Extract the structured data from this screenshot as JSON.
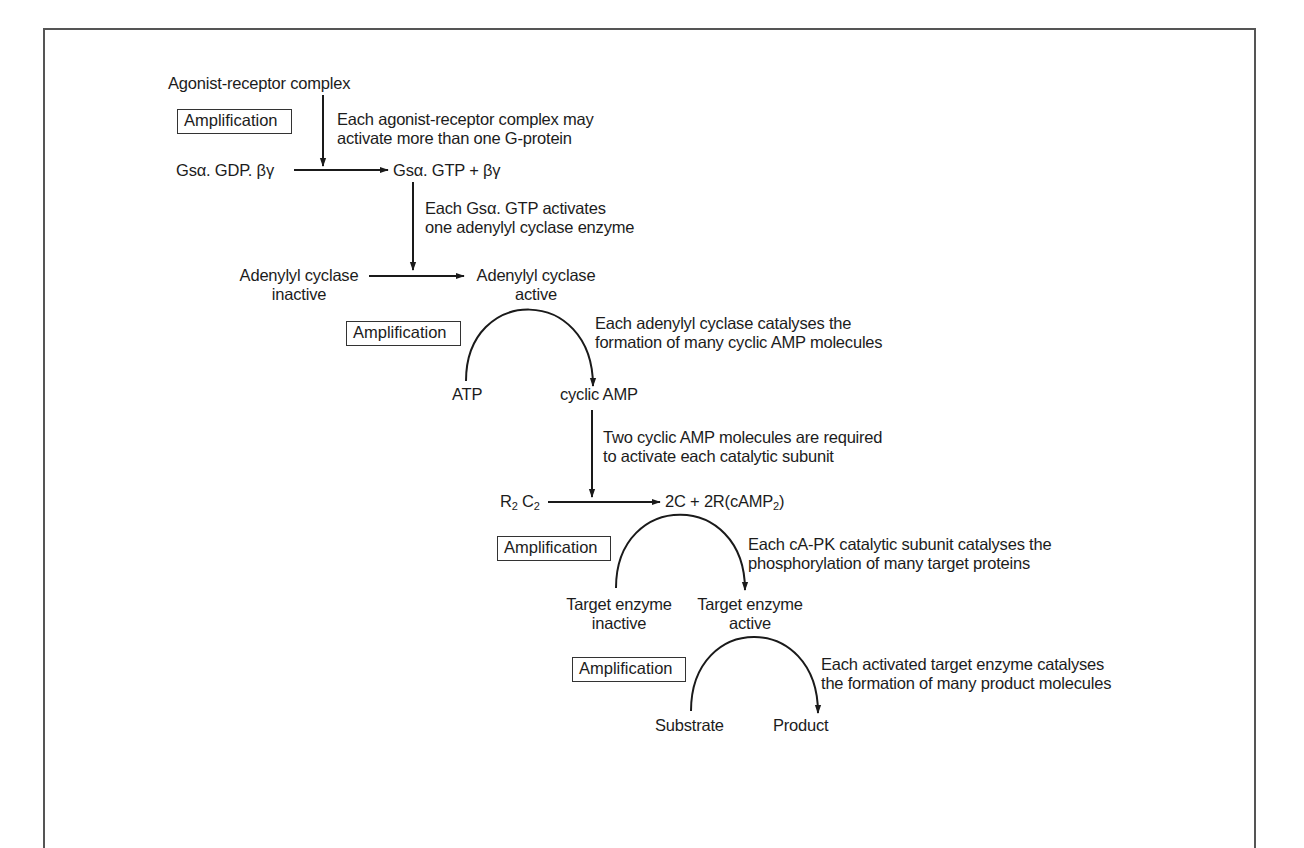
{
  "diagram": {
    "type": "signal-amplification-cascade",
    "nodes": {
      "agonist_receptor": "Agonist-receptor complex",
      "gs_gdp": "Gsα. GDP. βγ",
      "gs_gtp": "Gsα. GTP + βγ",
      "ac_inactive_line1": "Adenylyl cyclase",
      "ac_inactive_line2": "inactive",
      "ac_active_line1": "Adenylyl cyclase",
      "ac_active_line2": "active",
      "atp": "ATP",
      "camp": "cyclic AMP",
      "r2c2_r": "R",
      "r2c2_r_sub": "2",
      "r2c2_c": " C",
      "r2c2_c_sub": "2",
      "pk_active_prefix": "2C + 2R(cAMP",
      "pk_active_sub": "2",
      "pk_active_suffix": ")",
      "target_inactive_line1": "Target enzyme",
      "target_inactive_line2": "inactive",
      "target_active_line1": "Target enzyme",
      "target_active_line2": "active",
      "substrate": "Substrate",
      "product": "Product"
    },
    "notes": {
      "step1_line1": "Each agonist-receptor complex may",
      "step1_line2": "activate more than one G-protein",
      "step2_line1": "Each Gsα. GTP activates",
      "step2_line2": "one adenylyl cyclase enzyme",
      "step3_line1": "Each adenylyl cyclase catalyses the",
      "step3_line2": "formation of many cyclic AMP molecules",
      "step4_line1": "Two cyclic AMP molecules are required",
      "step4_line2": "to activate each catalytic subunit",
      "step5_line1": "Each cA-PK catalytic subunit catalyses the",
      "step5_line2": "phosphorylation of many target proteins",
      "step6_line1": "Each activated target enzyme catalyses",
      "step6_line2": "the formation of many product molecules"
    },
    "amplification_labels": [
      "Amplification",
      "Amplification",
      "Amplification",
      "Amplification"
    ],
    "colors": {
      "stroke": "#1a1a1a",
      "frame": "#555555",
      "background": "#ffffff"
    }
  }
}
